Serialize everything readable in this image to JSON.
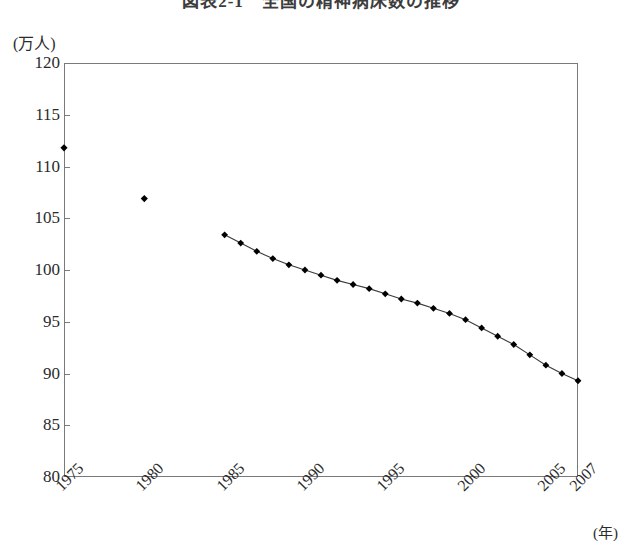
{
  "chart_data": {
    "type": "line",
    "title": "図表2-1　全国の精神病床数の推移",
    "ylabel": "(万人)",
    "xlabel": "(年)",
    "ylim": [
      80,
      120
    ],
    "yticks": [
      80,
      85,
      90,
      95,
      100,
      105,
      110,
      115,
      120
    ],
    "xlim": [
      1975,
      2007
    ],
    "xticks": [
      1975,
      1980,
      1985,
      1990,
      1995,
      2000,
      2005,
      2007
    ],
    "xtick_labels": [
      "1975",
      "1980",
      "1985",
      "1990",
      "1995",
      "2000",
      "2005",
      "2007"
    ],
    "grid": false,
    "legend": null,
    "marker": "diamond",
    "marker_color": "#000000",
    "line_color": "#3a3a3a",
    "frame_color": "#7a7a7a",
    "series": [
      {
        "name": "isolated-points",
        "connected": false,
        "x": [
          1975,
          1980
        ],
        "values": [
          111.8,
          106.9
        ]
      },
      {
        "name": "main-line",
        "connected": true,
        "x": [
          1985,
          1986,
          1987,
          1988,
          1989,
          1990,
          1991,
          1992,
          1993,
          1994,
          1995,
          1996,
          1997,
          1998,
          1999,
          2000,
          2001,
          2002,
          2003,
          2004,
          2005,
          2006,
          2007
        ],
        "values": [
          103.4,
          102.6,
          101.8,
          101.1,
          100.5,
          100.0,
          99.5,
          99.0,
          98.6,
          98.2,
          97.7,
          97.2,
          96.8,
          96.3,
          95.8,
          95.2,
          94.4,
          93.6,
          92.8,
          91.8,
          90.8,
          90.0,
          89.3
        ]
      }
    ]
  }
}
